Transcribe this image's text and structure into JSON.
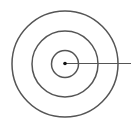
{
  "diagram": {
    "type": "concentric-circles-with-radius",
    "circle_count": 3,
    "has_center_point": true,
    "has_radius_line": true,
    "radius_line_direction": "right",
    "colors": {
      "stroke": "#555555",
      "center_point": "#111111",
      "background": "#ffffff"
    }
  }
}
